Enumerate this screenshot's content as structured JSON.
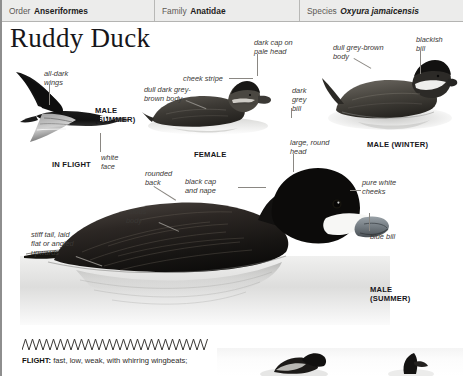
{
  "taxonomy": {
    "order": {
      "key": "Order",
      "value": "Anseriformes"
    },
    "family": {
      "key": "Family",
      "value": "Anatidae"
    },
    "species": {
      "key": "Species",
      "value": "Oxyura jamaicensis"
    }
  },
  "title": "Ruddy Duck",
  "annotations": {
    "all_dark_wings": "all-dark\nwings",
    "white_face": "white\nface",
    "cheek_stripe": "cheek stripe",
    "dull_dark_grey_brown_body": "dull dark grey-\nbrown body",
    "dark_cap_on_pale_head": "dark cap on\npale head",
    "dark_grey_bill": "dark\ngrey\nbill",
    "dull_grey_brown_body": "dull grey-brown\nbody",
    "blackish_bill": "blackish\nbill",
    "large_round_head": "large, round\nhead",
    "black_cap_and_nape": "black cap\nand nape",
    "rounded_back": "rounded\nback",
    "rufous_body": "rufous\nbody",
    "stiff_tail": "stiff tail, laid\nflat or angled\nupwards",
    "pure_white_cheeks": "pure white\ncheeks",
    "blue_bill": "blue bill"
  },
  "captions": {
    "in_flight": "IN FLIGHT",
    "male_summer_small": "MALE\n(SUMMER)",
    "female": "FEMALE",
    "male_winter": "MALE (WINTER)",
    "male_summer_main": "MALE\n(SUMMER)"
  },
  "flight": {
    "lead": "FLIGHT:",
    "text": " fast, low, weak, with whirring wingbeats;"
  },
  "colors": {
    "header_bg": "#ececeb",
    "header_rule": "#b4b4b2",
    "text_dark": "#1d1c1b",
    "anno_text": "#3a3835",
    "leader_line": "#8a8782"
  }
}
